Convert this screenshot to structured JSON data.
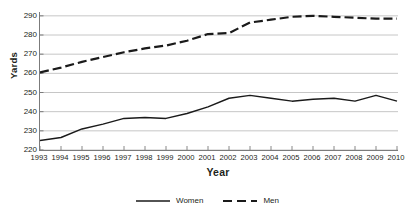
{
  "chart_data": {
    "type": "line",
    "title": "",
    "xlabel": "Year",
    "ylabel": "Yards",
    "x": [
      1993,
      1994,
      1995,
      1996,
      1997,
      1998,
      1999,
      2000,
      2001,
      2002,
      2003,
      2004,
      2005,
      2006,
      2007,
      2008,
      2009,
      2010
    ],
    "xticklabels": [
      "1993",
      "1994",
      "1995",
      "1996",
      "1997",
      "1998",
      "1999",
      "2000",
      "2001",
      "2002",
      "2003",
      "2004",
      "2005",
      "2006",
      "2007",
      "2008",
      "2009",
      "2010"
    ],
    "yticks": [
      220,
      230,
      240,
      250,
      260,
      270,
      280,
      290
    ],
    "yticklabels": [
      "220",
      "230",
      "240",
      "250",
      "260",
      "270",
      "280",
      "290"
    ],
    "ylim": [
      220,
      292
    ],
    "xlim": [
      1993,
      2010
    ],
    "grid": "horizontal",
    "legend_position": "bottom-center",
    "series": [
      {
        "name": "Women",
        "style": "solid",
        "color": "#1a1a1a",
        "values": [
          225.0,
          226.5,
          231.0,
          233.5,
          236.5,
          237.0,
          236.5,
          239.0,
          242.5,
          247.0,
          248.5,
          247.0,
          245.5,
          246.5,
          247.0,
          245.5,
          248.5,
          245.5
        ]
      },
      {
        "name": "Men",
        "style": "dashed",
        "color": "#1a1a1a",
        "values": [
          260.5,
          263.0,
          266.0,
          268.5,
          271.0,
          273.0,
          274.5,
          277.0,
          280.5,
          281.0,
          286.5,
          288.0,
          289.5,
          290.0,
          289.5,
          289.0,
          288.5,
          288.5
        ]
      }
    ]
  },
  "legend": {
    "items": [
      {
        "label": "Women",
        "style": "solid"
      },
      {
        "label": "Men",
        "style": "dashed"
      }
    ]
  },
  "colors": {
    "line": "#1a1a1a",
    "grid": "#b8b8b8",
    "axis": "#7b7b7b",
    "text": "#231f20",
    "background": "#ffffff"
  }
}
